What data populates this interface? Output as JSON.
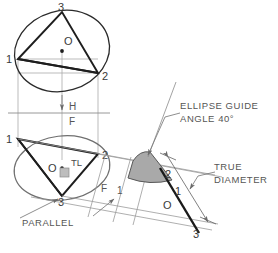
{
  "figure": {
    "type": "engineering-drawing",
    "background": "#ffffff",
    "ink_dark": "#1e1e1e",
    "ink_mid": "#5a5a5a",
    "ink_light": "#9a9a9a",
    "shade_fill": "#a9a9a9",
    "shade_stroke": "#555555"
  },
  "top_view": {
    "name": "top-view-ellipse",
    "vertices": [
      {
        "label": "1",
        "x": 18,
        "y": 59
      },
      {
        "label": "2",
        "x": 98,
        "y": 73
      },
      {
        "label": "3",
        "x": 62,
        "y": 12
      }
    ],
    "center": {
      "label": "O",
      "x": 62,
      "y": 51
    }
  },
  "front_view": {
    "name": "front-view-ellipse",
    "vertices": [
      {
        "label": "1",
        "x": 18,
        "y": 139
      },
      {
        "label": "2",
        "x": 98,
        "y": 154
      },
      {
        "label": "3",
        "x": 62,
        "y": 196
      }
    ],
    "center": {
      "label": "O",
      "x": 62,
      "y": 168
    },
    "true_length_label": "TL"
  },
  "aux_view": {
    "name": "auxiliary-view",
    "points": [
      {
        "label": "2",
        "x": 168,
        "y": 172
      },
      {
        "label": "1",
        "x": 178,
        "y": 190
      },
      {
        "label": "O",
        "x": 168,
        "y": 203
      },
      {
        "label": "3",
        "x": 199,
        "y": 231
      }
    ]
  },
  "fold_lines": [
    {
      "name": "fold-line-hf",
      "upper": "H",
      "lower": "F"
    },
    {
      "name": "fold-line-f1",
      "upper": "F",
      "lower": "1"
    }
  ],
  "notes": [
    {
      "name": "note-ellipse-guide",
      "line1": "ELLIPSE GUIDE",
      "line2": "ANGLE 40°"
    },
    {
      "name": "note-true-diameter",
      "line1": "TRUE",
      "line2": "DIAMETER"
    },
    {
      "name": "note-parallel",
      "line1": "PARALLEL"
    }
  ]
}
